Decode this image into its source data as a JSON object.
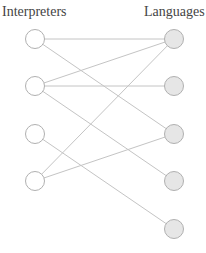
{
  "headers": {
    "left": "Interpreters",
    "right": "Languages"
  },
  "colors": {
    "edge": "#c4c4c4",
    "node_stroke": "#b0b0b0",
    "left_fill": "#ffffff",
    "right_fill": "#e6e6e6"
  },
  "left_nodes": [
    {
      "id": "I1",
      "x": 35,
      "y": 39
    },
    {
      "id": "I2",
      "x": 35,
      "y": 86
    },
    {
      "id": "I3",
      "x": 35,
      "y": 134
    },
    {
      "id": "I4",
      "x": 35,
      "y": 181
    }
  ],
  "right_nodes": [
    {
      "id": "L1",
      "x": 174,
      "y": 39
    },
    {
      "id": "L2",
      "x": 174,
      "y": 86
    },
    {
      "id": "L3",
      "x": 174,
      "y": 134
    },
    {
      "id": "L4",
      "x": 174,
      "y": 181
    },
    {
      "id": "L5",
      "x": 174,
      "y": 229
    }
  ],
  "edges": [
    [
      "I1",
      "L1"
    ],
    [
      "I1",
      "L3"
    ],
    [
      "I2",
      "L1"
    ],
    [
      "I2",
      "L2"
    ],
    [
      "I2",
      "L4"
    ],
    [
      "I3",
      "L5"
    ],
    [
      "I4",
      "L1"
    ],
    [
      "I4",
      "L3"
    ]
  ]
}
